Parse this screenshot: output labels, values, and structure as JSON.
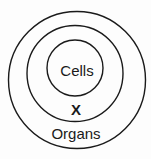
{
  "diagram": {
    "type": "concentric-circles",
    "labels": {
      "inner": "Cells",
      "middle": "X",
      "outer": "Organs"
    },
    "colors": {
      "stroke": "#1a1a1a",
      "background": "#fdfdfd"
    }
  }
}
